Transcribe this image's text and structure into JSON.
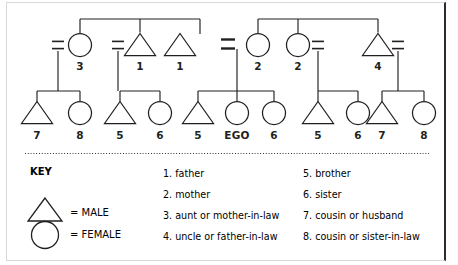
{
  "figure": {
    "type": "kinship-pedigree-diagram",
    "ego_label": "EGO",
    "line_color": "#231f20",
    "background": "#ffffff"
  },
  "generations": {
    "parent_row": {
      "nodes": [
        {
          "id": "p1",
          "shape": "circle",
          "label": "3",
          "cx": 80,
          "cy": 45
        },
        {
          "id": "p2",
          "shape": "triangle",
          "label": "1",
          "cx": 140,
          "cy": 45
        },
        {
          "id": "p3",
          "shape": "triangle",
          "label": "1",
          "cx": 180,
          "cy": 45
        },
        {
          "id": "p4",
          "shape": "circle",
          "label": "2",
          "cx": 258,
          "cy": 45
        },
        {
          "id": "p5",
          "shape": "circle",
          "label": "2",
          "cx": 298,
          "cy": 45
        },
        {
          "id": "p6",
          "shape": "triangle",
          "label": "4",
          "cx": 378,
          "cy": 45
        }
      ],
      "marriage_marks": [
        {
          "id": "m1",
          "x": 58,
          "y": 45,
          "bold": false
        },
        {
          "id": "m2",
          "x": 118,
          "y": 45,
          "bold": false
        },
        {
          "id": "m3",
          "x": 228,
          "y": 44,
          "bold": true
        },
        {
          "id": "m4",
          "x": 318,
          "y": 45,
          "bold": false
        },
        {
          "id": "m5",
          "x": 398,
          "y": 45,
          "bold": false
        }
      ],
      "sibling_bars": [
        {
          "id": "sb-left",
          "x1": 80,
          "x2": 200,
          "y": 19,
          "drops": [
            80,
            140,
            200
          ]
        },
        {
          "id": "sb-right",
          "x1": 258,
          "x2": 378,
          "y": 19,
          "drops": [
            258,
            298,
            378
          ]
        }
      ]
    },
    "child_row": {
      "nodes": [
        {
          "id": "c1",
          "shape": "triangle",
          "label": "7",
          "cx": 37,
          "cy": 113
        },
        {
          "id": "c2",
          "shape": "circle",
          "label": "8",
          "cx": 80,
          "cy": 113
        },
        {
          "id": "c3",
          "shape": "triangle",
          "label": "5",
          "cx": 120,
          "cy": 113
        },
        {
          "id": "c4",
          "shape": "circle",
          "label": "6",
          "cx": 160,
          "cy": 113
        },
        {
          "id": "c5",
          "shape": "triangle",
          "label": "5",
          "cx": 198,
          "cy": 113
        },
        {
          "id": "c6",
          "shape": "circle",
          "label": "EGO",
          "cx": 237,
          "cy": 113
        },
        {
          "id": "c7",
          "shape": "circle",
          "label": "6",
          "cx": 274,
          "cy": 113
        },
        {
          "id": "c8",
          "shape": "triangle",
          "label": "5",
          "cx": 318,
          "cy": 113
        },
        {
          "id": "c9",
          "shape": "circle",
          "label": "6",
          "cx": 358,
          "cy": 113
        },
        {
          "id": "c10",
          "shape": "triangle",
          "label": "7",
          "cx": 382,
          "cy": 113
        },
        {
          "id": "c11",
          "shape": "circle",
          "label": "8",
          "cx": 424,
          "cy": 113
        }
      ],
      "sibling_bars": [
        {
          "id": "cb1",
          "x1": 37,
          "x2": 80,
          "y": 91,
          "stem_x": 58
        },
        {
          "id": "cb2",
          "x1": 120,
          "x2": 160,
          "y": 91,
          "stem_x": 118
        },
        {
          "id": "cb3",
          "x1": 198,
          "x2": 274,
          "y": 91,
          "stem_x": 237
        },
        {
          "id": "cb4",
          "x1": 318,
          "x2": 358,
          "y": 91,
          "stem_x": 318
        },
        {
          "id": "cb5",
          "x1": 382,
          "x2": 424,
          "y": 91,
          "stem_x": 398
        }
      ],
      "descent_stems": [
        {
          "id": "ds1",
          "x": 58,
          "y1": 51,
          "y2": 91
        },
        {
          "id": "ds2",
          "x": 118,
          "y1": 51,
          "y2": 91
        },
        {
          "id": "ds3",
          "x": 237,
          "y1": 49,
          "y2": 91
        },
        {
          "id": "ds4",
          "x": 318,
          "y1": 51,
          "y2": 91
        },
        {
          "id": "ds5",
          "x": 398,
          "y1": 51,
          "y2": 91
        }
      ]
    }
  },
  "key": {
    "title": "KEY",
    "entries": [
      {
        "symbol": "triangle",
        "equals": "=",
        "label": "MALE"
      },
      {
        "symbol": "circle",
        "equals": "=",
        "label": "FEMALE"
      }
    ]
  },
  "legend_list": {
    "column_left": [
      "1. father",
      "2. mother",
      "3. aunt or mother-in-law",
      "4. uncle or father-in-law"
    ],
    "column_right": [
      "5. brother",
      "6. sister",
      "7. cousin or husband",
      "8. cousin or sister-in-law"
    ]
  }
}
